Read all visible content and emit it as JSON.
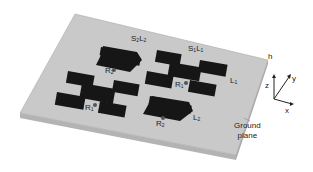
{
  "figure": {
    "type": "antenna-array-3d",
    "labels": {
      "s2l2": {
        "base": "S",
        "sub1": "2",
        "mid": "L",
        "sub2": "2"
      },
      "s1l1": {
        "base": "S",
        "sub1": "1",
        "mid": "L",
        "sub2": "1"
      },
      "h": "h",
      "l1": {
        "base": "L",
        "sub": "1"
      },
      "l2": {
        "base": "L",
        "sub": "2"
      },
      "r2_top": {
        "base": "R",
        "sub": "2"
      },
      "r1_right": {
        "base": "R",
        "sub": "1"
      },
      "r1_left": {
        "base": "R",
        "sub": "1"
      },
      "r2_bottom": {
        "base": "R",
        "sub": "2"
      },
      "ground_plane_line1": "Ground",
      "ground_plane_line2": "plane"
    },
    "axes": {
      "z": "z",
      "y": "y",
      "x": "x"
    },
    "colors": {
      "substrate": "#c8c8c8",
      "substrate_edge": "#b0b0b0",
      "patch": "#161616",
      "text": "#222222"
    }
  }
}
